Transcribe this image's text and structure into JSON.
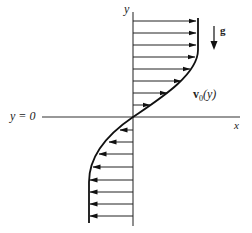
{
  "diagram": {
    "type": "velocity-profile",
    "axes": {
      "y_label": "y",
      "x_label": "x",
      "origin_label": "y = 0"
    },
    "gravity_label": "g",
    "profile_label": "v₀(y)",
    "profile_label_parts": {
      "v": "v",
      "sub": "0",
      "arg": "(y)"
    },
    "colors": {
      "line": "#111111",
      "background": "#ffffff",
      "text": "#222222"
    },
    "geometry": {
      "axis_x": 133,
      "zero_y": 117,
      "top_y": 12,
      "bottom_y": 226,
      "x_axis_left": 42,
      "x_axis_right": 240,
      "max_right": 198,
      "max_left": 89
    },
    "arrows_upper": [
      {
        "y": 21,
        "tip_x": 196
      },
      {
        "y": 33,
        "tip_x": 196
      },
      {
        "y": 45,
        "tip_x": 196
      },
      {
        "y": 57,
        "tip_x": 195
      },
      {
        "y": 69,
        "tip_x": 190
      },
      {
        "y": 81,
        "tip_x": 181
      },
      {
        "y": 93,
        "tip_x": 167
      },
      {
        "y": 105,
        "tip_x": 150
      }
    ],
    "arrows_lower": [
      {
        "y": 130,
        "tip_x": 120
      },
      {
        "y": 142,
        "tip_x": 109
      },
      {
        "y": 154,
        "tip_x": 99
      },
      {
        "y": 167,
        "tip_x": 93
      },
      {
        "y": 180,
        "tip_x": 90
      },
      {
        "y": 192,
        "tip_x": 90
      },
      {
        "y": 204,
        "tip_x": 90
      },
      {
        "y": 216,
        "tip_x": 90
      }
    ]
  }
}
